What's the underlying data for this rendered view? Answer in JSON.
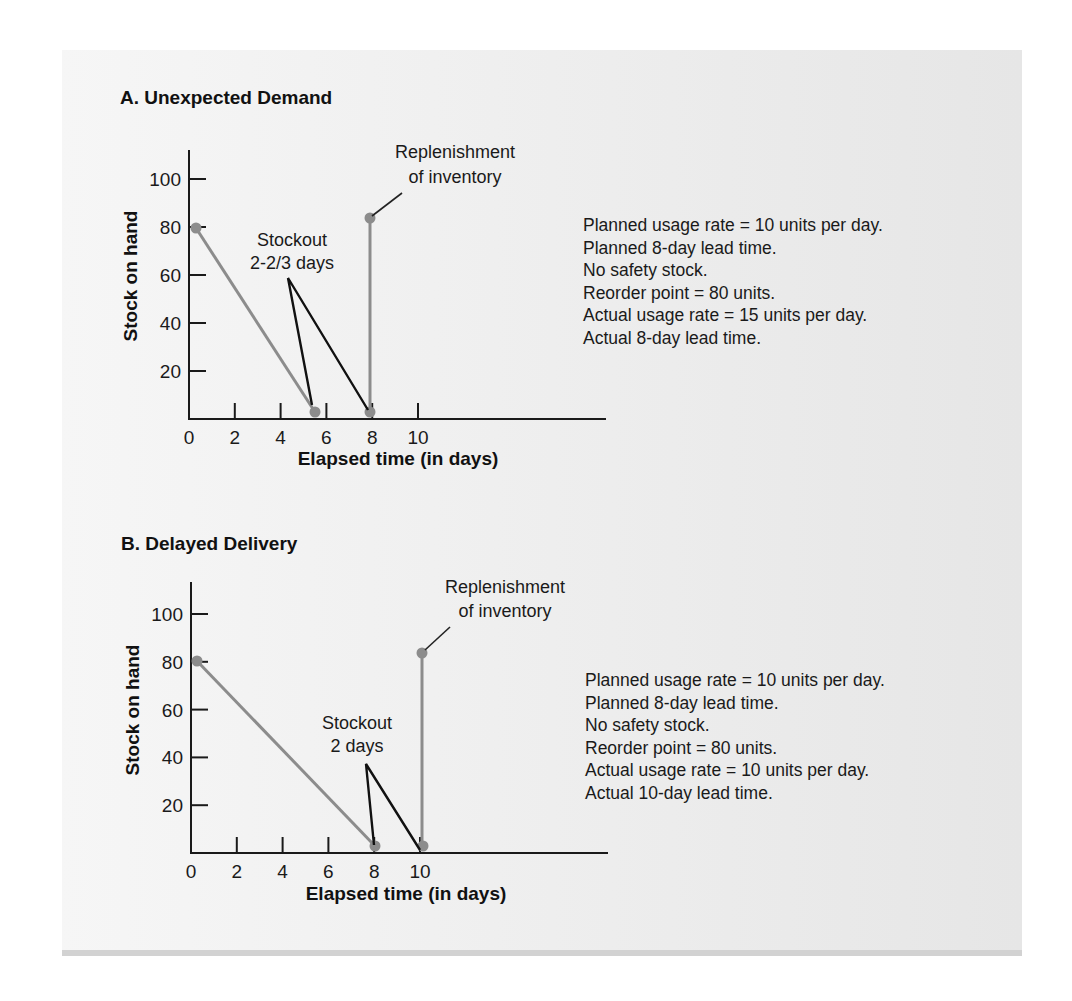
{
  "figure": {
    "panel_a": {
      "title": "A. Unexpected Demand",
      "ylabel": "Stock on hand",
      "xlabel": "Elapsed time (in days)",
      "annotation_stockout": [
        "Stockout",
        "2-2/3 days"
      ],
      "annotation_replenish": [
        "Replenishment",
        "of inventory"
      ],
      "notes": [
        "Planned usage rate = 10 units per day.",
        "Planned 8-day lead time.",
        "No safety stock.",
        "Reorder point = 80 units.",
        "Actual usage rate = 15 units per day.",
        "Actual 8-day lead time."
      ]
    },
    "panel_b": {
      "title": "B. Delayed Delivery",
      "ylabel": "Stock on hand",
      "xlabel": "Elapsed time (in days)",
      "annotation_stockout": [
        "Stockout",
        "2 days"
      ],
      "annotation_replenish": [
        "Replenishment",
        "of inventory"
      ],
      "notes": [
        "Planned usage rate = 10 units per day.",
        "Planned 8-day lead time.",
        "No safety stock.",
        "Reorder point = 80 units.",
        "Actual usage rate = 10 units per day.",
        "Actual 10-day lead time."
      ]
    }
  },
  "colors": {
    "background": "#efefef",
    "data_line": "#8c8c8c",
    "axis": "#1a1a1a",
    "text": "#1a1a1a"
  },
  "chart_data": [
    {
      "type": "line",
      "title": "A. Unexpected Demand",
      "xlabel": "Elapsed time (in days)",
      "ylabel": "Stock on hand",
      "x_ticks": [
        0,
        2,
        4,
        6,
        8,
        10
      ],
      "y_ticks": [
        20,
        40,
        60,
        80,
        100
      ],
      "xlim": [
        0,
        18
      ],
      "ylim": [
        0,
        110
      ],
      "grid": false,
      "series": [
        {
          "name": "Stock level (usage)",
          "x": [
            0.33,
            5.33
          ],
          "y": [
            80,
            0
          ]
        },
        {
          "name": "Replenishment",
          "x": [
            8,
            8
          ],
          "y": [
            0,
            80
          ]
        }
      ],
      "points": [
        {
          "x": 0.33,
          "y": 80
        },
        {
          "x": 5.33,
          "y": 0
        },
        {
          "x": 8,
          "y": 0
        },
        {
          "x": 8,
          "y": 80
        }
      ],
      "annotations": [
        {
          "text": "Stockout 2-2/3 days",
          "span_x": [
            5.33,
            8
          ]
        },
        {
          "text": "Replenishment of inventory",
          "at": {
            "x": 8,
            "y": 80
          }
        }
      ],
      "notes": [
        "Planned usage rate = 10 units per day.",
        "Planned 8-day lead time.",
        "No safety stock.",
        "Reorder point = 80 units.",
        "Actual usage rate = 15 units per day.",
        "Actual 8-day lead time."
      ]
    },
    {
      "type": "line",
      "title": "B. Delayed Delivery",
      "xlabel": "Elapsed time (in days)",
      "ylabel": "Stock on hand",
      "x_ticks": [
        0,
        2,
        4,
        6,
        8,
        10
      ],
      "y_ticks": [
        20,
        40,
        60,
        80,
        100
      ],
      "xlim": [
        0,
        18
      ],
      "ylim": [
        0,
        110
      ],
      "grid": false,
      "series": [
        {
          "name": "Stock level (usage)",
          "x": [
            0.33,
            8
          ],
          "y": [
            80,
            0
          ]
        },
        {
          "name": "Replenishment",
          "x": [
            10,
            10
          ],
          "y": [
            0,
            80
          ]
        }
      ],
      "points": [
        {
          "x": 0.33,
          "y": 80
        },
        {
          "x": 8,
          "y": 0
        },
        {
          "x": 10,
          "y": 0
        },
        {
          "x": 10,
          "y": 80
        }
      ],
      "annotations": [
        {
          "text": "Stockout 2 days",
          "span_x": [
            8,
            10
          ]
        },
        {
          "text": "Replenishment of inventory",
          "at": {
            "x": 10,
            "y": 80
          }
        }
      ],
      "notes": [
        "Planned usage rate = 10 units per day.",
        "Planned 8-day lead time.",
        "No safety stock.",
        "Reorder point = 80 units.",
        "Actual usage rate = 10 units per day.",
        "Actual 10-day lead time."
      ]
    }
  ]
}
